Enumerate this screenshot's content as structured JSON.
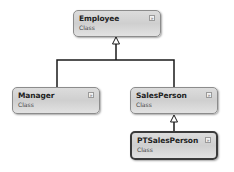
{
  "diagram": {
    "type": "class-diagram",
    "classes": [
      {
        "name": "Employee",
        "kind": "Class",
        "selected": false
      },
      {
        "name": "Manager",
        "kind": "Class",
        "selected": false
      },
      {
        "name": "SalesPerson",
        "kind": "Class",
        "selected": false
      },
      {
        "name": "PTSalesPerson",
        "kind": "Class",
        "selected": true
      }
    ],
    "relationships": [
      {
        "from": "Manager",
        "to": "Employee",
        "type": "inheritance"
      },
      {
        "from": "SalesPerson",
        "to": "Employee",
        "type": "inheritance"
      },
      {
        "from": "PTSalesPerson",
        "to": "SalesPerson",
        "type": "inheritance"
      }
    ],
    "toggle_icon": "double-chevron-down-icon",
    "toggle_glyph": "»"
  }
}
